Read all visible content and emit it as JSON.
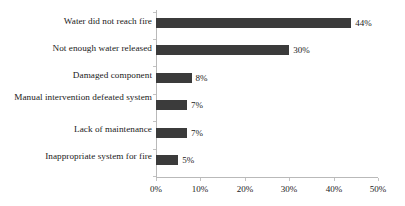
{
  "chart_data": {
    "type": "bar",
    "orientation": "horizontal",
    "title": "",
    "subtitle": "",
    "xlabel": "",
    "ylabel": "",
    "categories": [
      "Water did not reach fire",
      "Not enough water released",
      "Damaged component",
      "Manual intervention defeated system",
      "Lack of maintenance",
      "Inappropriate system for fire"
    ],
    "values": [
      44,
      30,
      8,
      7,
      7,
      5
    ],
    "data_labels": [
      "44%",
      "30%",
      "8%",
      "7%",
      "7%",
      "5%"
    ],
    "xlim": [
      0,
      50
    ],
    "xticks": [
      0,
      10,
      20,
      30,
      40,
      50
    ],
    "xtick_labels": [
      "0%",
      "10%",
      "20%",
      "30%",
      "40%",
      "50%"
    ],
    "grid": false,
    "legend": null,
    "legend_position": "none",
    "bar_color": "#3b3b3b",
    "axis_color": "#b9b9b9",
    "text_color": "#1a1a1a",
    "background_color": "#ffffff"
  }
}
